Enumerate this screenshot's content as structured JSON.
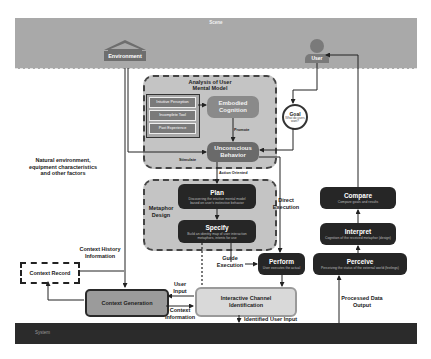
{
  "bands": {
    "scene": "Scene",
    "system": "System"
  },
  "actors": {
    "environment": "Environment",
    "user": "User"
  },
  "mental_model": {
    "title_line1": "Analysis of User",
    "title_line2": "Mental Model",
    "factors": [
      "Intuitive Perception",
      "Incomplete Tool",
      "Past Experience"
    ],
    "embodied_line1": "Embodied",
    "embodied_line2": "Cognition",
    "promote_label": "Promote",
    "unconscious_line1": "Unconscious",
    "unconscious_line2": "Behavior",
    "stimulate_label": "Stimulate",
    "action_oriented_label": "Action Oriented"
  },
  "goal": {
    "title": "Goal",
    "subtitle_line1": "What do users",
    "subtitle_line2": "want?"
  },
  "metaphor": {
    "label_line1": "Metaphor",
    "label_line2": "Design",
    "plan": {
      "title": "Plan",
      "desc_line1": "Discovering the intuitive mental model",
      "desc_line2": "based on user's instinctive behavior"
    },
    "specify": {
      "title": "Specify",
      "desc_line1": "Build an identity map of user interaction",
      "desc_line2": "metaphors, intents for use"
    }
  },
  "labels": {
    "natural_env_line1": "Natural environment,",
    "natural_env_line2": "equipment characteristics",
    "natural_env_line3": "and other factors",
    "context_history_line1": "Context History",
    "context_history_line2": "Information",
    "direct_exec_line1": "Direct",
    "direct_exec_line2": "Execution",
    "guide_exec_line1": "Guide",
    "guide_exec_line2": "Execution",
    "user_input_line1": "User",
    "user_input_line2": "Input",
    "context_info_line1": "Context",
    "context_info_line2": "Information",
    "identified_user_input": "Identified User Input",
    "processed_data_line1": "Processed Data",
    "processed_data_line2": "Output"
  },
  "boxes": {
    "context_record": "Context Record",
    "context_generation": "Context Generation",
    "icid_line1": "Interactive Channel",
    "icid_line2": "Identification",
    "perform": {
      "title": "Perform",
      "desc": "User executes the actual"
    },
    "compare": {
      "title": "Compare",
      "desc": "Compare goals and results"
    },
    "interpret": {
      "title": "Interpret",
      "desc": "Cognition of the received metaphor (design)"
    },
    "perceive": {
      "title": "Perceive",
      "desc": "Perceiving the status of the external world (feelings)"
    }
  },
  "colors": {
    "scene_band": "#a9a9a9",
    "system_band": "#2b2b2b",
    "dark_box": "#262626",
    "panel_fill": "#c4c4c4",
    "context_generation": "#9b9b9b",
    "icid_fill": "#d9d9d9"
  }
}
